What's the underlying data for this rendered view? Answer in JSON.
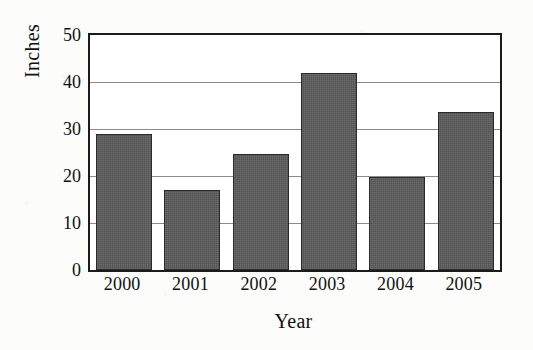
{
  "chart_data": {
    "type": "bar",
    "title": "",
    "xlabel": "Year",
    "ylabel": "Inches",
    "categories": [
      "2000",
      "2001",
      "2002",
      "2003",
      "2004",
      "2005"
    ],
    "values": [
      29,
      17,
      24.7,
      42,
      19.8,
      33.6
    ],
    "ylim": [
      0,
      50
    ],
    "yticks": [
      0,
      10,
      20,
      30,
      40,
      50
    ],
    "ytick_labels": [
      "0",
      "10",
      "20",
      "30",
      "40",
      "50"
    ],
    "grid": "horizontal",
    "legend": "none",
    "bar_color": "#5b5b5b",
    "axis_color": "#1b1b1b",
    "gridline_color": "#8b8b8b",
    "background_color": "#ffffff"
  }
}
